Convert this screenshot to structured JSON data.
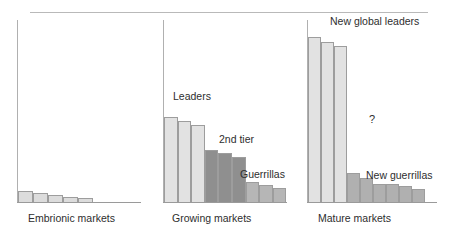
{
  "figure": {
    "title": "",
    "panel_count": 3
  },
  "chart_data": {
    "type": "bar",
    "title": "",
    "xlabel": "",
    "ylabel": "",
    "grid": false,
    "legend_position": "inline-annotations",
    "panels": [
      {
        "id": "embrionic",
        "caption": "Embrionic markets",
        "annotations": [],
        "series": [
          {
            "name": "fragmented players",
            "color": "#dcdcdc",
            "values": [
              11,
              9,
              7,
              5.5,
              4
            ]
          }
        ],
        "bar_count": 5
      },
      {
        "id": "growing",
        "caption": "Growing markets",
        "annotations": [
          {
            "text": "Leaders",
            "group": "leaders"
          },
          {
            "text": "2nd tier",
            "group": "second-tier"
          },
          {
            "text": "Guerrillas",
            "group": "guerrillas"
          }
        ],
        "series": [
          {
            "name": "Leaders",
            "color": "#e2e2e2",
            "values": [
              85,
              81,
              77
            ]
          },
          {
            "name": "2nd tier",
            "color": "#8f8f8f",
            "values": [
              52,
              49,
              45
            ]
          },
          {
            "name": "Guerrillas",
            "color": "#b6b6b6",
            "values": [
              20,
              17,
              14
            ]
          }
        ],
        "bar_count": 9
      },
      {
        "id": "mature",
        "caption": "Mature markets",
        "annotations": [
          {
            "text": "New global leaders",
            "group": "new-global-leaders"
          },
          {
            "text": "?",
            "group": "gap-question"
          },
          {
            "text": "New guerrillas",
            "group": "new-guerrillas"
          }
        ],
        "series": [
          {
            "name": "New global leaders",
            "color": "#e2e2e2",
            "values": [
              165,
              160,
              156
            ]
          },
          {
            "name": "New guerrillas",
            "color": "#b0b0b0",
            "values": [
              29,
              24,
              18,
              18,
              16,
              13
            ]
          }
        ],
        "bar_count": 9
      }
    ]
  },
  "colors": {
    "light_bar": "#e2e2e2",
    "pale_bar": "#dcdcdc",
    "mid_bar": "#b6b6b6",
    "dark_bar": "#8f8f8f",
    "bar_stroke": "#9d9d9d",
    "axis": "#9a9a9a",
    "rule": "#b9b9b9",
    "text": "#2e2e2e"
  },
  "panel1": {
    "caption": "Embrionic markets"
  },
  "panel2": {
    "caption": "Growing markets",
    "label_leaders": "Leaders",
    "label_second_tier": "2nd tier",
    "label_guerrillas": "Guerrillas"
  },
  "panel3": {
    "caption": "Mature markets",
    "label_new_global_leaders": "New global leaders",
    "label_question": "?",
    "label_new_guerrillas": "New guerrillas"
  }
}
